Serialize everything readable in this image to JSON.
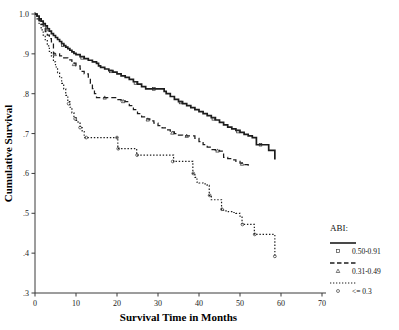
{
  "chart_data": {
    "type": "line",
    "title": "",
    "subtitle": "",
    "xlabel": "Survival Time in Months",
    "ylabel": "Cumulative Survival",
    "xlim": [
      0,
      70
    ],
    "ylim": [
      0.3,
      1.0
    ],
    "xticks": [
      "0",
      "10",
      "20",
      "30",
      "40",
      "50",
      "60",
      "70"
    ],
    "xtick_values": [
      0,
      10,
      20,
      30,
      40,
      50,
      60,
      70
    ],
    "yticks": [
      "1.0",
      ".9",
      ".8",
      ".7",
      ".6",
      ".5",
      ".4",
      ".3"
    ],
    "ytick_values": [
      1.0,
      0.9,
      0.8,
      0.7,
      0.6,
      0.5,
      0.4,
      0.3
    ],
    "grid": false,
    "legend_position": "right-bottom",
    "curve_shape": "step",
    "series": [
      {
        "name": "0.50-0.91",
        "line_style": "solid",
        "marker": "square",
        "color": "#1c1c1c",
        "points": [
          [
            0,
            1.0
          ],
          [
            0.5,
            0.995
          ],
          [
            1.0,
            0.988
          ],
          [
            1.5,
            0.982
          ],
          [
            2.0,
            0.976
          ],
          [
            2.5,
            0.97
          ],
          [
            3.0,
            0.963
          ],
          [
            3.5,
            0.957
          ],
          [
            4.0,
            0.951
          ],
          [
            4.5,
            0.946
          ],
          [
            5.0,
            0.941
          ],
          [
            5.5,
            0.936
          ],
          [
            6.0,
            0.931
          ],
          [
            6.5,
            0.926
          ],
          [
            7.0,
            0.921
          ],
          [
            7.5,
            0.917
          ],
          [
            8.0,
            0.913
          ],
          [
            8.5,
            0.909
          ],
          [
            9.0,
            0.905
          ],
          [
            9.5,
            0.901
          ],
          [
            10.0,
            0.898
          ],
          [
            11.0,
            0.893
          ],
          [
            12.0,
            0.888
          ],
          [
            13.0,
            0.884
          ],
          [
            14.0,
            0.88
          ],
          [
            15.0,
            0.876
          ],
          [
            15.5,
            0.87
          ],
          [
            16.0,
            0.866
          ],
          [
            17.0,
            0.862
          ],
          [
            18.0,
            0.858
          ],
          [
            19.0,
            0.854
          ],
          [
            20.0,
            0.85
          ],
          [
            21.0,
            0.845
          ],
          [
            22.0,
            0.841
          ],
          [
            23.0,
            0.836
          ],
          [
            24.0,
            0.83
          ],
          [
            25.0,
            0.824
          ],
          [
            26.0,
            0.818
          ],
          [
            27.0,
            0.812
          ],
          [
            28.0,
            0.812
          ],
          [
            29.0,
            0.812
          ],
          [
            30.0,
            0.812
          ],
          [
            31.0,
            0.812
          ],
          [
            31.5,
            0.806
          ],
          [
            32.0,
            0.8
          ],
          [
            33.0,
            0.793
          ],
          [
            34.0,
            0.786
          ],
          [
            35.0,
            0.78
          ],
          [
            36.0,
            0.775
          ],
          [
            37.0,
            0.77
          ],
          [
            38.0,
            0.765
          ],
          [
            39.0,
            0.76
          ],
          [
            40.0,
            0.755
          ],
          [
            41.0,
            0.75
          ],
          [
            42.0,
            0.745
          ],
          [
            43.0,
            0.74
          ],
          [
            44.0,
            0.734
          ],
          [
            45.0,
            0.728
          ],
          [
            46.0,
            0.722
          ],
          [
            47.0,
            0.716
          ],
          [
            48.0,
            0.712
          ],
          [
            49.0,
            0.708
          ],
          [
            50.0,
            0.703
          ],
          [
            51.0,
            0.698
          ],
          [
            52.0,
            0.694
          ],
          [
            53.0,
            0.69
          ],
          [
            54.0,
            0.672
          ],
          [
            56.0,
            0.672
          ],
          [
            57.0,
            0.658
          ],
          [
            58.0,
            0.658
          ],
          [
            58.5,
            0.635
          ]
        ],
        "censor_points": [
          [
            3.2,
            0.961
          ],
          [
            6.8,
            0.922
          ],
          [
            11.5,
            0.89
          ],
          [
            18.5,
            0.856
          ],
          [
            24.5,
            0.827
          ],
          [
            29.0,
            0.812
          ],
          [
            35.5,
            0.778
          ],
          [
            43.5,
            0.737
          ],
          [
            49.5,
            0.705
          ],
          [
            55.0,
            0.672
          ]
        ]
      },
      {
        "name": "0.31-0.49",
        "line_style": "dashed",
        "marker": "triangle",
        "color": "#1c1c1c",
        "points": [
          [
            0,
            1.0
          ],
          [
            0.5,
            0.992
          ],
          [
            1.0,
            0.983
          ],
          [
            1.5,
            0.974
          ],
          [
            2.0,
            0.965
          ],
          [
            2.5,
            0.956
          ],
          [
            3.0,
            0.947
          ],
          [
            3.5,
            0.938
          ],
          [
            4.0,
            0.93
          ],
          [
            4.5,
            0.9
          ],
          [
            5.5,
            0.9
          ],
          [
            6.0,
            0.895
          ],
          [
            7.0,
            0.89
          ],
          [
            8.0,
            0.885
          ],
          [
            9.0,
            0.877
          ],
          [
            10.0,
            0.87
          ],
          [
            11.0,
            0.862
          ],
          [
            11.5,
            0.856
          ],
          [
            12.0,
            0.85
          ],
          [
            13.0,
            0.838
          ],
          [
            13.5,
            0.826
          ],
          [
            14.0,
            0.813
          ],
          [
            14.5,
            0.8
          ],
          [
            15.0,
            0.79
          ],
          [
            16.0,
            0.79
          ],
          [
            17.0,
            0.79
          ],
          [
            18.0,
            0.79
          ],
          [
            19.0,
            0.79
          ],
          [
            20.0,
            0.785
          ],
          [
            21.0,
            0.782
          ],
          [
            22.0,
            0.78
          ],
          [
            23.0,
            0.77
          ],
          [
            24.0,
            0.76
          ],
          [
            25.0,
            0.75
          ],
          [
            26.0,
            0.742
          ],
          [
            27.0,
            0.737
          ],
          [
            28.0,
            0.732
          ],
          [
            29.0,
            0.726
          ],
          [
            30.0,
            0.72
          ],
          [
            31.0,
            0.714
          ],
          [
            32.0,
            0.709
          ],
          [
            33.0,
            0.704
          ],
          [
            34.0,
            0.7
          ],
          [
            35.0,
            0.696
          ],
          [
            36.0,
            0.694
          ],
          [
            37.0,
            0.694
          ],
          [
            38.0,
            0.694
          ],
          [
            39.0,
            0.688
          ],
          [
            40.0,
            0.68
          ],
          [
            41.0,
            0.672
          ],
          [
            42.0,
            0.666
          ],
          [
            43.0,
            0.66
          ],
          [
            44.0,
            0.658
          ],
          [
            45.0,
            0.656
          ],
          [
            46.0,
            0.64
          ],
          [
            47.0,
            0.637
          ],
          [
            48.0,
            0.634
          ],
          [
            49.0,
            0.63
          ],
          [
            50.0,
            0.626
          ],
          [
            51.0,
            0.622
          ],
          [
            52.0,
            0.615
          ]
        ],
        "censor_points": [
          [
            4.8,
            0.899
          ],
          [
            9.5,
            0.874
          ],
          [
            17.0,
            0.79
          ],
          [
            21.5,
            0.781
          ],
          [
            27.5,
            0.735
          ],
          [
            33.5,
            0.702
          ],
          [
            37.0,
            0.694
          ],
          [
            44.5,
            0.657
          ],
          [
            50.5,
            0.624
          ]
        ]
      },
      {
        "name": "<= 0.3",
        "line_style": "dotted",
        "marker": "circle",
        "color": "#1c1c1c",
        "points": [
          [
            0,
            1.0
          ],
          [
            0.5,
            0.988
          ],
          [
            1.0,
            0.974
          ],
          [
            1.5,
            0.96
          ],
          [
            2.0,
            0.947
          ],
          [
            2.5,
            0.933
          ],
          [
            3.0,
            0.92
          ],
          [
            3.5,
            0.906
          ],
          [
            4.0,
            0.893
          ],
          [
            4.5,
            0.88
          ],
          [
            5.0,
            0.867
          ],
          [
            5.5,
            0.853
          ],
          [
            6.0,
            0.84
          ],
          [
            6.5,
            0.826
          ],
          [
            7.0,
            0.812
          ],
          [
            7.5,
            0.796
          ],
          [
            8.0,
            0.78
          ],
          [
            8.5,
            0.766
          ],
          [
            9.0,
            0.752
          ],
          [
            9.5,
            0.74
          ],
          [
            10.0,
            0.733
          ],
          [
            10.5,
            0.726
          ],
          [
            11.0,
            0.715
          ],
          [
            11.5,
            0.705
          ],
          [
            12.0,
            0.69
          ],
          [
            13.0,
            0.69
          ],
          [
            14.0,
            0.69
          ],
          [
            15.0,
            0.69
          ],
          [
            16.0,
            0.69
          ],
          [
            17.0,
            0.69
          ],
          [
            18.0,
            0.69
          ],
          [
            19.0,
            0.69
          ],
          [
            20.0,
            0.69
          ],
          [
            20.2,
            0.662
          ],
          [
            21.0,
            0.662
          ],
          [
            22.0,
            0.662
          ],
          [
            23.0,
            0.662
          ],
          [
            24.0,
            0.662
          ],
          [
            24.8,
            0.646
          ],
          [
            26.0,
            0.646
          ],
          [
            28.0,
            0.646
          ],
          [
            30.0,
            0.646
          ],
          [
            32.0,
            0.646
          ],
          [
            33.5,
            0.646
          ],
          [
            33.8,
            0.63
          ],
          [
            35.0,
            0.63
          ],
          [
            36.0,
            0.63
          ],
          [
            37.0,
            0.63
          ],
          [
            38.0,
            0.63
          ],
          [
            38.5,
            0.6
          ],
          [
            39.0,
            0.59
          ],
          [
            39.5,
            0.578
          ],
          [
            40.0,
            0.576
          ],
          [
            41.0,
            0.574
          ],
          [
            42.0,
            0.57
          ],
          [
            42.5,
            0.545
          ],
          [
            43.0,
            0.534
          ],
          [
            44.0,
            0.534
          ],
          [
            45.0,
            0.534
          ],
          [
            45.5,
            0.51
          ],
          [
            46.0,
            0.506
          ],
          [
            47.0,
            0.504
          ],
          [
            48.0,
            0.502
          ],
          [
            49.0,
            0.5
          ],
          [
            50.0,
            0.493
          ],
          [
            50.5,
            0.472
          ],
          [
            52.0,
            0.472
          ],
          [
            53.0,
            0.472
          ],
          [
            53.5,
            0.447
          ],
          [
            55.0,
            0.447
          ],
          [
            57.0,
            0.447
          ],
          [
            58.3,
            0.447
          ],
          [
            58.5,
            0.392
          ]
        ],
        "censor_points": [
          [
            8.2,
            0.775
          ],
          [
            9.8,
            0.737
          ],
          [
            11.0,
            0.715
          ],
          [
            12.5,
            0.69
          ],
          [
            20.0,
            0.69
          ],
          [
            20.3,
            0.662
          ],
          [
            24.9,
            0.646
          ],
          [
            33.6,
            0.63
          ],
          [
            38.6,
            0.6
          ],
          [
            42.6,
            0.545
          ],
          [
            45.6,
            0.51
          ],
          [
            50.6,
            0.472
          ],
          [
            53.6,
            0.447
          ],
          [
            58.5,
            0.392
          ]
        ]
      }
    ]
  },
  "legend": {
    "title": "ABI:",
    "entries": [
      {
        "label": "0.50-0.91",
        "style": "solid",
        "marker": "square"
      },
      {
        "label": "0.31-0.49",
        "style": "dashed",
        "marker": "triangle"
      },
      {
        "label": "<= 0.3",
        "style": "dotted",
        "marker": "circle"
      }
    ]
  }
}
